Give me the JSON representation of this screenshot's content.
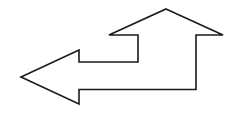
{
  "diagram": {
    "shape": {
      "type": "polygon",
      "stroke": "#1a1a1a",
      "fill": "#ffffff",
      "stroke_width": 1.6,
      "points": "166,9 223,35 196,35 196,89.5 79,89.5 79,104 21,77 79,50 79,62 138,62 138,35 109,35"
    },
    "arrowheads": [
      {
        "direction": "up",
        "tip": [
          166,
          9
        ]
      },
      {
        "direction": "left",
        "tip": [
          21,
          77
        ]
      }
    ]
  }
}
